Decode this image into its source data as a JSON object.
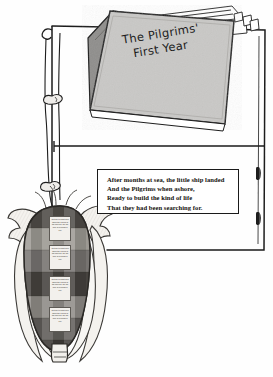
{
  "page": {
    "kind": "scanned-illustration-page",
    "background_color": "#fefefe",
    "ink_color": "#1a1a1a"
  },
  "book": {
    "title_line_1": "The Pilgrims'",
    "title_line_2": "First Year",
    "cover_color": "#c9c8c6",
    "spine_color": "#8f8e8c"
  },
  "poem": {
    "lines": [
      "After months at sea, the little ship landed",
      "And the Pilgrims when ashore,",
      "Ready to build the kind of life",
      "That they had been searching for."
    ]
  },
  "corn": {
    "note_text": "It's time to plant corn when the leaves of the oak tree are the size of a mouse's ear.",
    "notes": [
      "It's time to plant corn when the leaves of the oak tree are the size of a mouse's ear.",
      "It's time to plant corn when the leaves of the oak tree are the size of a mouse's ear.",
      "It's time to plant corn when the leaves of the oak tree are the size of a mouse's ear.",
      "It's time to plant corn when the leaves of the oak tree are the size of a mouse's ear."
    ],
    "kernel_dark_color": "#5a5751",
    "kernel_mid_color": "#8d8a84",
    "kernel_light_color": "#c9c6c0",
    "husk_color": "#f3f1ed"
  },
  "frame": {
    "binder_slot_count": 2,
    "has_horizontal_rule": true
  }
}
